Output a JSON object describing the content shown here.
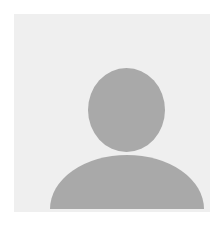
{
  "avatar": {
    "label": "",
    "type": "default-user-placeholder",
    "colors": {
      "background": "#efefef",
      "silhouette": "#a9a9a9"
    }
  }
}
